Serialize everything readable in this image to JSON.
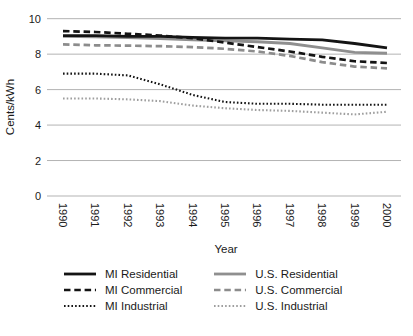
{
  "chart_data": {
    "type": "line",
    "title": "",
    "xlabel": "Year",
    "ylabel": "Cents/kWh",
    "ylim": [
      0,
      10
    ],
    "yticks": [
      0,
      2,
      4,
      6,
      8,
      10
    ],
    "grid": "horizontal",
    "legend_position": "bottom-two-columns",
    "x": [
      "1990",
      "1991",
      "1992",
      "1993",
      "1994",
      "1995",
      "1996",
      "1997",
      "1998",
      "1999",
      "2000"
    ],
    "series": [
      {
        "name": "MI Residential",
        "color": "#141414",
        "style": "solid",
        "values": [
          9.05,
          9.05,
          9.0,
          9.0,
          8.95,
          8.9,
          8.9,
          8.85,
          8.8,
          8.6,
          8.35
        ]
      },
      {
        "name": "MI Commercial",
        "color": "#141414",
        "style": "dashed",
        "values": [
          9.3,
          9.25,
          9.15,
          9.05,
          8.9,
          8.65,
          8.4,
          8.15,
          7.85,
          7.6,
          7.5
        ]
      },
      {
        "name": "MI Industrial",
        "color": "#141414",
        "style": "dotted",
        "values": [
          6.9,
          6.9,
          6.8,
          6.3,
          5.7,
          5.3,
          5.2,
          5.2,
          5.15,
          5.15,
          5.15
        ]
      },
      {
        "name": "U.S. Residential",
        "color": "#8f8f8f",
        "style": "solid",
        "values": [
          9.0,
          8.97,
          8.93,
          8.88,
          8.8,
          8.75,
          8.7,
          8.6,
          8.35,
          8.1,
          8.05
        ]
      },
      {
        "name": "U.S. Commercial",
        "color": "#8c8c8c",
        "style": "dashed",
        "values": [
          8.55,
          8.5,
          8.48,
          8.45,
          8.4,
          8.3,
          8.15,
          7.9,
          7.55,
          7.3,
          7.2
        ]
      },
      {
        "name": "U.S. Industrial",
        "color": "#9e9e9e",
        "style": "dotted",
        "values": [
          5.5,
          5.5,
          5.45,
          5.35,
          5.1,
          4.95,
          4.85,
          4.8,
          4.7,
          4.6,
          4.75
        ]
      }
    ],
    "colors": {
      "grid_line": "#b3b3b3",
      "text": "#1a1a1a"
    }
  }
}
